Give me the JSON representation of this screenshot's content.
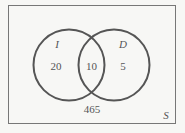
{
  "diagram": {
    "type": "venn",
    "universe_label": "S",
    "sets": [
      {
        "label": "I",
        "only_count": "20"
      },
      {
        "label": "D",
        "only_count": "5"
      }
    ],
    "intersection_count": "10",
    "outside_count": "465",
    "colors": {
      "stroke": "#555555",
      "background": "#f7f7f5",
      "text": "#555555"
    }
  }
}
